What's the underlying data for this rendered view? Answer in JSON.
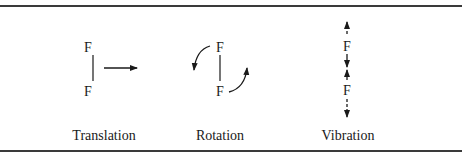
{
  "diagram": {
    "atom_symbol": "F",
    "panels": [
      {
        "id": "translation",
        "caption": "Translation",
        "top_atom": "F",
        "bottom_atom": "F"
      },
      {
        "id": "rotation",
        "caption": "Rotation",
        "top_atom": "F",
        "bottom_atom": "F"
      },
      {
        "id": "vibration",
        "caption": "Vibration",
        "top_atom": "F",
        "bottom_atom": "F"
      }
    ]
  },
  "colors": {
    "ink": "#1a1a1a",
    "rule": "#3a3a3a",
    "background": "#ffffff"
  }
}
